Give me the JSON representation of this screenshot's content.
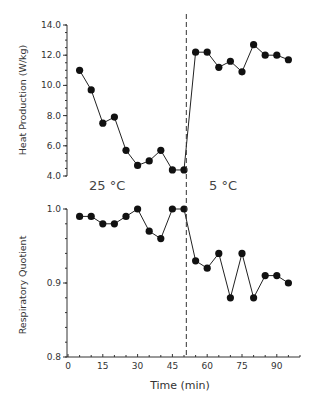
{
  "chart_data": [
    {
      "type": "line",
      "title": "",
      "xlabel": "",
      "ylabel": "Heat Production (W/kg)",
      "ylim": [
        4.0,
        14.0
      ],
      "yticks": [
        "4.0",
        "6.0",
        "8.0",
        "10.0",
        "12.0",
        "14.0"
      ],
      "xlim": [
        0,
        100
      ],
      "grid": false,
      "legend": "none",
      "annotations": [
        {
          "text": "25 °C",
          "x": 12,
          "y": "below-axis"
        },
        {
          "text": "5 °C",
          "x": 65,
          "y": "below-axis"
        }
      ],
      "divider_x": 51,
      "series": [
        {
          "name": "Heat Production",
          "x": [
            5,
            10,
            15,
            20,
            25,
            30,
            35,
            40,
            45,
            50,
            55,
            60,
            65,
            70,
            75,
            80,
            85,
            90,
            95
          ],
          "values": [
            11.0,
            9.7,
            7.5,
            7.9,
            5.7,
            4.7,
            5.0,
            5.7,
            4.4,
            4.4,
            12.2,
            12.2,
            11.2,
            11.6,
            10.9,
            12.7,
            12.0,
            12.0,
            11.7
          ]
        }
      ]
    },
    {
      "type": "line",
      "title": "",
      "xlabel": "Time (min)",
      "ylabel": "Respiratory Quotient",
      "ylim": [
        0.8,
        1.0
      ],
      "yticks": [
        "0.8",
        "0.9",
        "1.0"
      ],
      "xlim": [
        0,
        100
      ],
      "xticks": [
        "0",
        "15",
        "30",
        "45",
        "60",
        "75",
        "90"
      ],
      "grid": false,
      "legend": "none",
      "divider_x": 51,
      "series": [
        {
          "name": "Respiratory Quotient",
          "x": [
            5,
            10,
            15,
            20,
            25,
            30,
            35,
            40,
            45,
            50,
            55,
            60,
            65,
            70,
            75,
            80,
            85,
            90,
            95
          ],
          "values": [
            0.99,
            0.99,
            0.98,
            0.98,
            0.99,
            1.0,
            0.97,
            0.96,
            1.0,
            1.0,
            0.93,
            0.92,
            0.94,
            0.88,
            0.94,
            0.88,
            0.91,
            0.91,
            0.9
          ]
        }
      ]
    }
  ],
  "labels": {
    "top_ylabel": "Heat Production (W/kg)",
    "bottom_ylabel": "Respiratory Quotient",
    "xlabel": "Time (min)",
    "cond_warm": "25 °C",
    "cond_cold": "5 °C"
  }
}
